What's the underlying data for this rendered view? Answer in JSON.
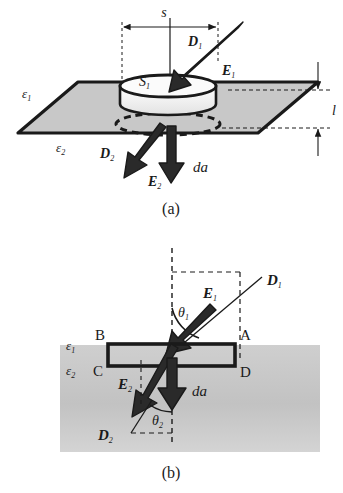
{
  "figure": {
    "panels": [
      {
        "id": "a",
        "caption": "(a)",
        "description": "Perspective view of a pillbox (Gaussian surface) straddling the planar boundary between two dielectrics",
        "labels": {
          "width_dimension": "s",
          "thickness_dimension": "l",
          "pillbox_top_area": "S",
          "pillbox_top_area_sub": "1",
          "permittivity_upper": "ε",
          "permittivity_upper_sub": "1",
          "permittivity_lower": "ε",
          "permittivity_lower_sub": "2",
          "D_upper": "D",
          "D_upper_sub": "1",
          "E_upper": "E",
          "E_upper_sub": "1",
          "D_lower": "D",
          "D_lower_sub": "2",
          "E_lower": "E",
          "E_lower_sub": "2",
          "area_element": "da"
        }
      },
      {
        "id": "b",
        "caption": "(b)",
        "description": "Cross-sectional view showing rectangle ABCD across the interface with refraction angles",
        "labels": {
          "corner_top_left": "B",
          "corner_top_right": "A",
          "corner_bottom_left": "C",
          "corner_bottom_right": "D",
          "permittivity_upper": "ε",
          "permittivity_upper_sub": "1",
          "permittivity_lower": "ε",
          "permittivity_lower_sub": "2",
          "angle_upper": "θ",
          "angle_upper_sub": "1",
          "angle_lower": "θ",
          "angle_lower_sub": "2",
          "D_upper": "D",
          "D_upper_sub": "1",
          "E_upper": "E",
          "E_upper_sub": "1",
          "D_lower": "D",
          "D_lower_sub": "2",
          "E_lower": "E",
          "E_lower_sub": "2",
          "area_element": "da"
        }
      }
    ],
    "colors": {
      "ink": "#1a1a1a",
      "plane_fill": "#c8c8c8",
      "pillbox_fill": "#f2f2f2",
      "medium_fill": "#c4c4c4",
      "background": "#ffffff"
    }
  }
}
